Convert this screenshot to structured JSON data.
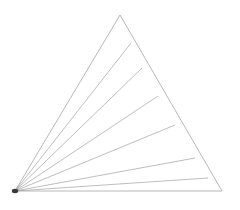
{
  "figure": {
    "background_color": "#ffffff",
    "stroke_color": "#9a9a9a",
    "cevian_color": "#a2a2a2",
    "apex_color": "#3a3a3a",
    "stroke_width": 0.7,
    "canvas": {
      "width": 240,
      "height": 210
    }
  },
  "chart_data": {
    "type": "line",
    "xlabel": "",
    "ylabel": "",
    "grid": false,
    "legend": "none",
    "xlim": [
      0,
      240
    ],
    "ylim": [
      0,
      210
    ],
    "vertices": {
      "apex": {
        "name": "lower-left apex",
        "x": 15,
        "y": 191
      },
      "top": {
        "name": "top vertex",
        "x": 120,
        "y": 15
      },
      "right": {
        "name": "lower-right vertex",
        "x": 222,
        "y": 191
      }
    },
    "outline": {
      "name": "triangle-outline",
      "points": [
        [
          15,
          191
        ],
        [
          120,
          15
        ],
        [
          222,
          191
        ],
        [
          15,
          191
        ]
      ]
    },
    "cevians": [
      {
        "name": "cevian-1",
        "from": [
          15,
          191
        ],
        "to": [
          131,
          43
        ]
      },
      {
        "name": "cevian-2",
        "from": [
          15,
          191
        ],
        "to": [
          142,
          68
        ]
      },
      {
        "name": "cevian-3",
        "from": [
          15,
          191
        ],
        "to": [
          158,
          96
        ]
      },
      {
        "name": "cevian-4",
        "from": [
          15,
          191
        ],
        "to": [
          175,
          125
        ]
      },
      {
        "name": "cevian-5",
        "from": [
          15,
          191
        ],
        "to": [
          195,
          158
        ]
      },
      {
        "name": "cevian-6",
        "from": [
          15,
          191
        ],
        "to": [
          208,
          178
        ]
      }
    ],
    "cevian_count": 6,
    "apex_marker": {
      "name": "apex-convergence-blob",
      "x": 15,
      "y": 191,
      "rx": 3.2,
      "ry": 2.2
    }
  }
}
